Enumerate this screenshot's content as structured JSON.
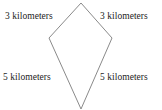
{
  "figure": {
    "type": "geometry-diagram",
    "shape_name": "kite",
    "background_color": "#ffffff",
    "stroke_color": "#8a8a8a",
    "text_color": "#1c1c1c",
    "vertices": {
      "top": {
        "x": 81,
        "y": 3
      },
      "left": {
        "x": 49,
        "y": 38
      },
      "right": {
        "x": 112,
        "y": 38
      },
      "bottom": {
        "x": 81,
        "y": 109
      }
    }
  },
  "labels": {
    "top_left": "3 kilometers",
    "top_right": "3 kilometers",
    "bottom_left": "5 kilometers",
    "bottom_right": "5 kilometers"
  }
}
